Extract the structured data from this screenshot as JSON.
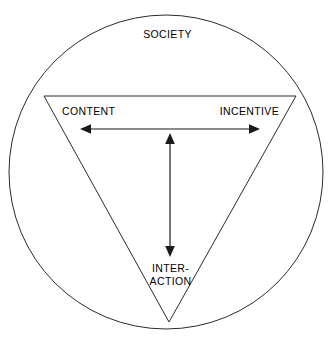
{
  "diagram": {
    "type": "venn-triangle-in-circle",
    "canvas": {
      "width": 335,
      "height": 344,
      "background": "#ffffff"
    },
    "colors": {
      "outline": "#2b2b2b",
      "arrow": "#1a1a1a",
      "text": "#000000",
      "background": "#ffffff"
    },
    "shapes": {
      "circle": {
        "name": "society-circle",
        "cx": 166,
        "cy": 172,
        "r": 157,
        "stroke": "#2b2b2b",
        "fill": "none"
      },
      "triangle": {
        "name": "inverted-triangle",
        "orientation": "inverted",
        "vertices": [
          {
            "label_key": "content",
            "x": 44,
            "y": 96
          },
          {
            "label_key": "incentive",
            "x": 296,
            "y": 96
          },
          {
            "label_key": "interaction",
            "x": 169,
            "y": 322
          }
        ],
        "stroke": "#2b2b2b",
        "fill": "none"
      }
    },
    "arrows": [
      {
        "name": "content-incentive-arrow",
        "orientation": "horizontal",
        "double_headed": true,
        "connects": [
          "CONTENT",
          "INCENTIVE"
        ],
        "x1": 82,
        "y1": 129,
        "x2": 258,
        "y2": 129
      },
      {
        "name": "incentive-interaction-arrow",
        "orientation": "vertical",
        "double_headed": true,
        "connects": [
          "CONTENT / INCENTIVE axis",
          "INTER-ACTION"
        ],
        "x1": 170,
        "y1": 134,
        "x2": 170,
        "y2": 256
      }
    ],
    "labels": {
      "society": "SOCIETY",
      "content": "CONTENT",
      "incentive": "INCENTIVE",
      "interaction_line1": "INTER-",
      "interaction_line2": "ACTION"
    }
  }
}
